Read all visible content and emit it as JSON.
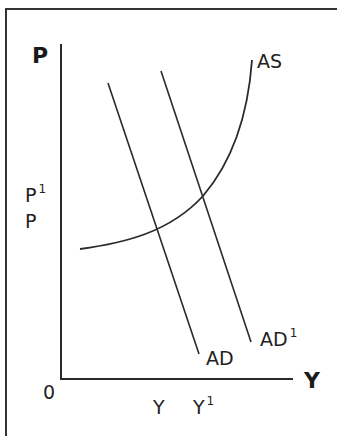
{
  "diagram": {
    "axes": {
      "y_label": "P",
      "x_label": "Y",
      "origin_label": "0"
    },
    "price_ticks": [
      {
        "label": "P",
        "sup": "1"
      },
      {
        "label": "P",
        "sup": ""
      }
    ],
    "output_ticks": [
      {
        "label": "Y",
        "sup": ""
      },
      {
        "label": "Y",
        "sup": "1"
      }
    ],
    "curves": [
      {
        "name": "AS",
        "label": "AS",
        "sup": "",
        "type": "curve",
        "shape": "upward-sloping, convex"
      },
      {
        "name": "AD",
        "label": "AD",
        "sup": "",
        "type": "line",
        "shape": "downward-sloping"
      },
      {
        "name": "AD1",
        "label": "AD",
        "sup": "1",
        "type": "line",
        "shape": "downward-sloping, shifted right"
      }
    ],
    "colors": {
      "line": "#2a2a2a",
      "background": "#ffffff"
    }
  }
}
